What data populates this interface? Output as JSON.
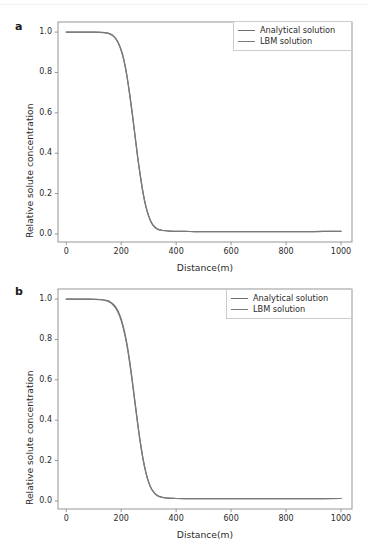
{
  "figure": {
    "background_color": "#ffffff",
    "panels": [
      {
        "label": "a",
        "xlabel": "Distance(m)",
        "ylabel": "Relative solute concentration",
        "xticks": [
          "0",
          "200",
          "400",
          "600",
          "800",
          "1000"
        ],
        "yticks": [
          "0.0",
          "0.2",
          "0.4",
          "0.6",
          "0.8",
          "1.0"
        ],
        "legend": [
          {
            "label": "Analytical solution",
            "color": "#6e6e6e"
          },
          {
            "label": "LBM solution",
            "color": "#7a7a7a"
          }
        ]
      },
      {
        "label": "b",
        "xlabel": "Distance(m)",
        "ylabel": "Relative solute concentration",
        "xticks": [
          "0",
          "200",
          "400",
          "600",
          "800",
          "1000"
        ],
        "yticks": [
          "0.0",
          "0.2",
          "0.4",
          "0.6",
          "0.8",
          "1.0"
        ],
        "legend": [
          {
            "label": "Analytical solution",
            "color": "#6e6e6e"
          },
          {
            "label": "LBM solution",
            "color": "#7a7a7a"
          }
        ]
      }
    ]
  },
  "chart_data": [
    {
      "type": "line",
      "title": "",
      "panel_label": "a",
      "xlabel": "Distance(m)",
      "ylabel": "Relative solute concentration",
      "xlim": [
        -30,
        1040
      ],
      "ylim": [
        -0.04,
        1.05
      ],
      "xticks": [
        0,
        200,
        400,
        600,
        800,
        1000
      ],
      "yticks": [
        0.0,
        0.2,
        0.4,
        0.6,
        0.8,
        1.0
      ],
      "grid": false,
      "legend_position": "upper right",
      "x": [
        0,
        25,
        50,
        75,
        100,
        125,
        150,
        160,
        170,
        180,
        190,
        200,
        210,
        220,
        230,
        240,
        250,
        260,
        270,
        280,
        290,
        300,
        310,
        320,
        330,
        340,
        350,
        375,
        400,
        450,
        500,
        600,
        700,
        800,
        900,
        1000
      ],
      "series": [
        {
          "name": "Analytical solution",
          "color": "#6e6e6e",
          "values": [
            1.0,
            1.0,
            1.0,
            1.0,
            1.0,
            0.999,
            0.995,
            0.99,
            0.982,
            0.968,
            0.945,
            0.91,
            0.86,
            0.79,
            0.7,
            0.6,
            0.49,
            0.38,
            0.285,
            0.2,
            0.135,
            0.088,
            0.056,
            0.037,
            0.026,
            0.02,
            0.017,
            0.014,
            0.013,
            0.012,
            0.012,
            0.012,
            0.012,
            0.012,
            0.012,
            0.013
          ]
        },
        {
          "name": "LBM solution",
          "color": "#7a7a7a",
          "values": [
            1.0,
            1.0,
            1.0,
            1.0,
            1.0,
            0.999,
            0.995,
            0.99,
            0.982,
            0.968,
            0.945,
            0.91,
            0.86,
            0.79,
            0.7,
            0.6,
            0.49,
            0.38,
            0.285,
            0.2,
            0.135,
            0.088,
            0.056,
            0.037,
            0.026,
            0.02,
            0.017,
            0.014,
            0.013,
            0.012,
            0.012,
            0.012,
            0.012,
            0.012,
            0.012,
            0.013
          ]
        }
      ]
    },
    {
      "type": "line",
      "title": "",
      "panel_label": "b",
      "xlabel": "Distance(m)",
      "ylabel": "Relative solute concentration",
      "xlim": [
        -30,
        1040
      ],
      "ylim": [
        -0.04,
        1.05
      ],
      "xticks": [
        0,
        200,
        400,
        600,
        800,
        1000
      ],
      "yticks": [
        0.0,
        0.2,
        0.4,
        0.6,
        0.8,
        1.0
      ],
      "grid": false,
      "legend_position": "upper right",
      "x": [
        0,
        25,
        50,
        75,
        100,
        125,
        150,
        160,
        170,
        180,
        190,
        200,
        210,
        220,
        230,
        240,
        250,
        260,
        270,
        280,
        290,
        300,
        310,
        320,
        330,
        340,
        350,
        375,
        400,
        450,
        500,
        600,
        700,
        800,
        900,
        1000
      ],
      "series": [
        {
          "name": "Analytical solution",
          "color": "#6e6e6e",
          "values": [
            1.0,
            1.0,
            1.0,
            1.0,
            0.999,
            0.998,
            0.992,
            0.986,
            0.976,
            0.96,
            0.936,
            0.9,
            0.85,
            0.785,
            0.7,
            0.6,
            0.492,
            0.385,
            0.288,
            0.205,
            0.14,
            0.093,
            0.06,
            0.04,
            0.027,
            0.021,
            0.017,
            0.013,
            0.012,
            0.011,
            0.011,
            0.011,
            0.011,
            0.011,
            0.011,
            0.012
          ]
        },
        {
          "name": "LBM solution",
          "color": "#7a7a7a",
          "values": [
            1.0,
            1.0,
            1.0,
            1.0,
            0.999,
            0.997,
            0.99,
            0.983,
            0.972,
            0.955,
            0.93,
            0.894,
            0.843,
            0.777,
            0.693,
            0.594,
            0.487,
            0.381,
            0.285,
            0.203,
            0.139,
            0.092,
            0.06,
            0.041,
            0.029,
            0.022,
            0.018,
            0.014,
            0.012,
            0.011,
            0.011,
            0.011,
            0.011,
            0.011,
            0.011,
            0.012
          ]
        }
      ]
    }
  ]
}
